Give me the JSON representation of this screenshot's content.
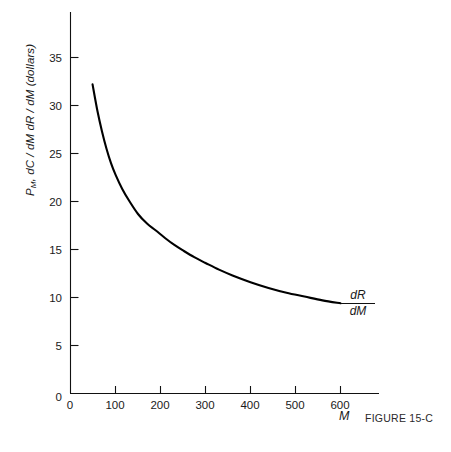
{
  "figure": {
    "caption": "FIGURE 15-C"
  },
  "chart_data": {
    "type": "line",
    "title": "",
    "subtitle": "",
    "xlabel": "M",
    "ylabel_parts": {
      "p": "P",
      "p_sub": "M",
      "rest": ", dC / dM  dR / dM (dollars)"
    },
    "ylabel": "P_M, dC/dM dR/dM (dollars)",
    "xlim": [
      0,
      680
    ],
    "ylim": [
      0,
      40
    ],
    "xticks": [
      0,
      100,
      200,
      300,
      400,
      500,
      600
    ],
    "xtick_labels": [
      "0",
      "100",
      "200",
      "300",
      "400",
      "500",
      "600"
    ],
    "yticks": [
      0,
      5,
      10,
      15,
      20,
      25,
      30,
      35
    ],
    "ytick_labels": [
      "0",
      "5",
      "10",
      "15",
      "20",
      "25",
      "30",
      "35"
    ],
    "grid": false,
    "legend": "none",
    "annotations": [
      {
        "name": "curve-label",
        "numerator": "dR",
        "denominator": "dM",
        "text": "dR/dM",
        "x": 620,
        "y": 9.6
      }
    ],
    "series": [
      {
        "name": "dR/dM",
        "color": "#000000",
        "x": [
          49,
          60,
          70,
          80,
          90,
          100,
          115,
          130,
          150,
          170,
          189,
          210,
          230,
          250,
          275,
          300,
          330,
          360,
          400,
          440,
          480,
          520,
          560,
          600
        ],
        "y": [
          32.2,
          29.4,
          27.3,
          25.5,
          24.0,
          22.8,
          21.3,
          20.1,
          18.7,
          17.7,
          17.0,
          16.2,
          15.5,
          14.9,
          14.2,
          13.6,
          12.9,
          12.3,
          11.6,
          11.0,
          10.5,
          10.1,
          9.7,
          9.4
        ]
      }
    ]
  }
}
